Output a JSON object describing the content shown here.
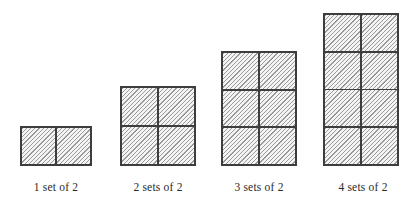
{
  "figure": {
    "groups": [
      {
        "label": "1 set of 2",
        "sets": 1,
        "items_per_set": 2,
        "rows": 1,
        "cols": 2,
        "total_squares": 2
      },
      {
        "label": "2 sets of 2",
        "sets": 2,
        "items_per_set": 2,
        "rows": 2,
        "cols": 2,
        "total_squares": 4
      },
      {
        "label": "3 sets of 2",
        "sets": 3,
        "items_per_set": 2,
        "rows": 3,
        "cols": 2,
        "total_squares": 6
      },
      {
        "label": "4 sets of 2",
        "sets": 4,
        "items_per_set": 2,
        "rows": 4,
        "cols": 2,
        "total_squares": 8
      }
    ],
    "colors": {
      "background": "#ffffff",
      "border": "#3d3d3d",
      "hatch_line": "#9a9a9a",
      "hatch_bg": "#f4f4f4",
      "label_text": "#2b2b2b"
    }
  }
}
